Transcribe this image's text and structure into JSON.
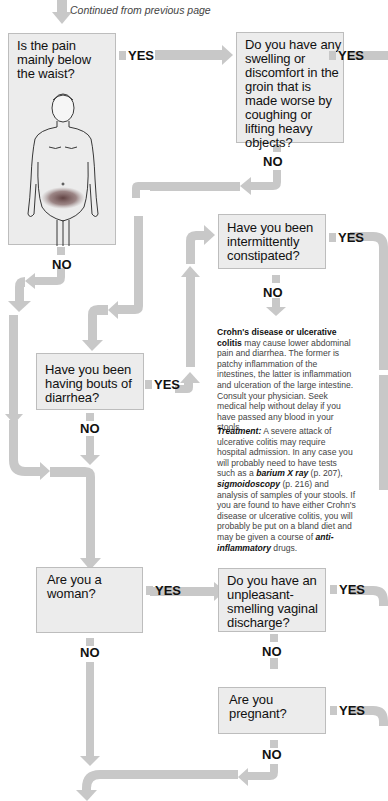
{
  "header": {
    "continued": "Continued from previous page"
  },
  "colors": {
    "arrow": "#c8c8c8",
    "box_bg": "#ececec",
    "box_border": "#bdbdbd",
    "shading": "#6a4a4a"
  },
  "questions": {
    "q1": "Is the pain mainly below the waist?",
    "q2": "Do you have any swelling or discomfort in the groin that is made worse by coughing or lifting heavy objects?",
    "q3": "Have you been intermittently constipated?",
    "q4": "Have you been having bouts of diarrhea?",
    "q5": "Are you a woman?",
    "q6": "Do you have an unpleasant-smelling vaginal discharge?",
    "q7": "Are you pregnant?"
  },
  "labels": {
    "yes": "YES",
    "no": "NO"
  },
  "info": {
    "title1": "Crohn's disease or ulcerative colitis",
    "body1": " may cause lower abdominal pain and diarrhea. The former is patchy inflammation of the intestines, the latter is inflammation and ulceration of the large intestine. Consult your physician. Seek medical help without delay if you have passed any blood in your stools.",
    "treatment_label": "Treatment:",
    "t1": " A severe attack of ulcerative colitis may require hospital admission. In any case you will probably need to have tests such as a ",
    "link1": "barium X ray",
    "t2": " (p. 207), ",
    "link2": "sigmoidoscopy",
    "t3": " (p. 216) and analysis of samples of your stools. If you are found to have either Crohn's disease or ulcerative colitis, you will probably be put on a bland diet and may be given a course of ",
    "link3": "anti-inflammatory",
    "t4": " drugs."
  },
  "figure": {
    "icon": "male-body-figure-icon",
    "highlight": "lower-abdomen"
  }
}
